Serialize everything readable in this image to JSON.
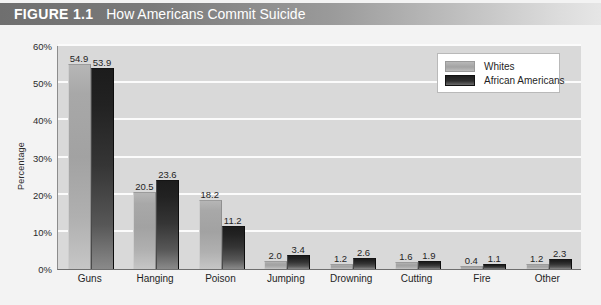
{
  "figure": {
    "number": "FIGURE 1.1",
    "title": "How Americans Commit Suicide"
  },
  "legend": {
    "items": [
      {
        "label": "Whites",
        "color": "#a8a8a8"
      },
      {
        "label": "African Americans",
        "color": "#222222"
      }
    ]
  },
  "axis": {
    "y_title": "Percentage",
    "y_ticks": [
      "0%",
      "10%",
      "20%",
      "30%",
      "40%",
      "50%",
      "60%"
    ]
  },
  "chart_data": {
    "type": "bar",
    "title": "How Americans Commit Suicide",
    "xlabel": "",
    "ylabel": "Percentage",
    "ylim": [
      0,
      60
    ],
    "ytick_values": [
      0,
      10,
      20,
      30,
      40,
      50,
      60
    ],
    "grid": true,
    "legend_position": "top-right",
    "categories": [
      "Guns",
      "Hanging",
      "Poison",
      "Jumping",
      "Drowning",
      "Cutting",
      "Fire",
      "Other"
    ],
    "series": [
      {
        "name": "Whites",
        "color": "#a8a8a8",
        "values": [
          54.9,
          20.5,
          18.2,
          2.0,
          1.2,
          1.6,
          0.4,
          1.2
        ],
        "labels": [
          "54.9",
          "20.5",
          "18.2",
          "2.0",
          "1.2",
          "1.6",
          "0.4",
          "1.2"
        ]
      },
      {
        "name": "African Americans",
        "color": "#222222",
        "values": [
          53.9,
          23.6,
          11.2,
          3.4,
          2.6,
          1.9,
          1.1,
          2.3
        ],
        "labels": [
          "53.9",
          "23.6",
          "11.2",
          "3.4",
          "2.6",
          "1.9",
          "1.1",
          "2.3"
        ]
      }
    ]
  }
}
